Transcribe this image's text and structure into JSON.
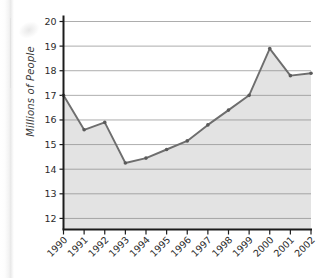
{
  "chart_data": {
    "type": "area",
    "title": "",
    "subtitle": "",
    "xlabel": "",
    "ylabel": "Millions of People",
    "categories": [
      "1990",
      "1991",
      "1992",
      "1993",
      "1994",
      "1995",
      "1996",
      "1997",
      "1998",
      "1999",
      "2000",
      "2001",
      "2002"
    ],
    "values": [
      17.0,
      15.6,
      15.9,
      14.25,
      14.45,
      14.8,
      15.15,
      15.8,
      16.4,
      17.0,
      18.9,
      17.8,
      17.9
    ],
    "series": [
      {
        "name": "Millions of People",
        "values": [
          17.0,
          15.6,
          15.9,
          14.25,
          14.45,
          14.8,
          15.15,
          15.8,
          16.4,
          17.0,
          18.9,
          17.8,
          17.9
        ]
      }
    ],
    "ylim": [
      11.55,
      20
    ],
    "yticks": [
      12,
      13,
      14,
      15,
      16,
      17,
      18,
      19,
      20
    ],
    "ytick_labels": [
      "12",
      "13",
      "14",
      "15",
      "16",
      "17",
      "18",
      "19",
      "20"
    ],
    "xtick_labels": [
      "1990",
      "1991",
      "1992",
      "1993",
      "1994",
      "1995",
      "1996",
      "1997",
      "1998",
      "1999",
      "2000",
      "2001",
      "2002"
    ],
    "grid": true,
    "grid_axis": "y",
    "legend": false,
    "legend_position": "none",
    "markers": true,
    "annotations": []
  },
  "style": {
    "area_fill": "#e3e3e3",
    "line_color": "#6e6e6e",
    "marker_color": "#5a5a5a",
    "grid_color": "#8a8a8a",
    "axis_color": "#1c1c1c",
    "text_color": "#2b2b2b",
    "background": "#ffffff"
  }
}
